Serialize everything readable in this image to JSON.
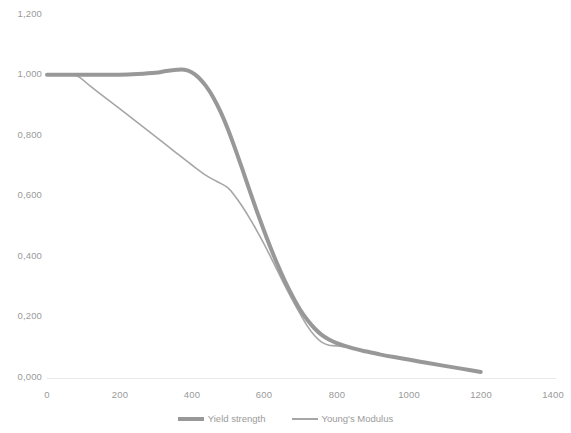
{
  "chart_data": {
    "type": "line",
    "title": "",
    "subtitle": "",
    "xlabel": "",
    "ylabel": "",
    "xlim": [
      0,
      1400
    ],
    "ylim": [
      0.0,
      1.2
    ],
    "grid": false,
    "legend_position": "bottom",
    "decimal_separator": ",",
    "x_ticks": [
      0,
      200,
      400,
      600,
      800,
      1000,
      1200,
      1400
    ],
    "x_tick_labels": [
      "0",
      "200",
      "400",
      "600",
      "800",
      "1000",
      "1200",
      "1400"
    ],
    "y_ticks": [
      0.0,
      0.2,
      0.4,
      0.6,
      0.8,
      1.0,
      1.2
    ],
    "y_tick_labels": [
      "0,000",
      "0,200",
      "0,400",
      "0,600",
      "0,800",
      "1,000",
      "1,200"
    ],
    "series": [
      {
        "name": "Yield strength",
        "color": "#989898",
        "line_width": 4,
        "x": [
          0,
          50,
          100,
          150,
          200,
          250,
          300,
          330,
          360,
          380,
          400,
          420,
          440,
          460,
          480,
          500,
          520,
          540,
          560,
          580,
          600,
          620,
          640,
          660,
          680,
          700,
          720,
          740,
          760,
          780,
          800,
          840,
          880,
          920,
          960,
          1000,
          1050,
          1100,
          1150,
          1200
        ],
        "y": [
          1.0,
          1.0,
          1.0,
          1.0,
          1.0,
          1.002,
          1.006,
          1.012,
          1.016,
          1.016,
          1.008,
          0.99,
          0.962,
          0.925,
          0.878,
          0.822,
          0.758,
          0.69,
          0.62,
          0.552,
          0.487,
          0.425,
          0.368,
          0.315,
          0.268,
          0.226,
          0.192,
          0.164,
          0.142,
          0.127,
          0.116,
          0.1,
          0.088,
          0.078,
          0.069,
          0.061,
          0.05,
          0.04,
          0.03,
          0.02
        ]
      },
      {
        "name": "Young's Modulus",
        "color": "#a6a6a6",
        "line_width": 1.6,
        "x": [
          0,
          40,
          80,
          120,
          160,
          200,
          240,
          280,
          320,
          360,
          400,
          440,
          470,
          500,
          520,
          540,
          560,
          580,
          600,
          620,
          640,
          660,
          680,
          700,
          720,
          740,
          760,
          780,
          800,
          840,
          880,
          920,
          960,
          1000,
          1050,
          1100,
          1150,
          1200
        ],
        "y": [
          1.0,
          1.0,
          0.998,
          0.962,
          0.925,
          0.889,
          0.852,
          0.815,
          0.778,
          0.74,
          0.703,
          0.668,
          0.648,
          0.628,
          0.6,
          0.566,
          0.528,
          0.487,
          0.443,
          0.396,
          0.348,
          0.3,
          0.255,
          0.212,
          0.172,
          0.14,
          0.118,
          0.108,
          0.106,
          0.1,
          0.09,
          0.08,
          0.071,
          0.062,
          0.05,
          0.04,
          0.03,
          0.02
        ]
      }
    ]
  },
  "axes": {
    "y_labels": [
      "1,200",
      "1,000",
      "0,800",
      "0,600",
      "0,400",
      "0,200",
      "0,000"
    ],
    "x_labels": [
      "0",
      "200",
      "400",
      "600",
      "800",
      "1000",
      "1200",
      "1400"
    ]
  },
  "legend": {
    "items": [
      {
        "label": "Yield strength",
        "marker": "thick-line-swatch"
      },
      {
        "label": "Young's Modulus",
        "marker": "thin-line-swatch"
      }
    ]
  },
  "colors": {
    "yield_strength": "#989898",
    "youngs_modulus": "#a6a6a6",
    "axis_text": "#9a9a9a",
    "axis_line": "#e4e4e4",
    "background": "#ffffff"
  }
}
